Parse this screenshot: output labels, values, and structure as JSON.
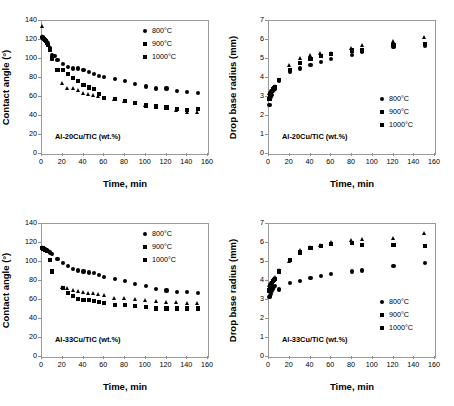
{
  "figure": {
    "xlabel": "Time, min",
    "ylabel_angle": "Contact angle (°)",
    "ylabel_radius": "Drop base radius (mm)",
    "legend_labels": [
      "800°C",
      "900°C",
      "1000°C"
    ],
    "marker_color": "#000000",
    "frame_color": "#9a9a9a"
  },
  "panels": {
    "top_left": {
      "annotation": "Al-20Cu/TiC (wt.%)"
    },
    "top_right": {
      "annotation": "Al-20Cu/TiC (wt.%)"
    },
    "bottom_left": {
      "annotation": "Al-33Cu/TiC (wt.%)"
    },
    "bottom_right": {
      "annotation": "Al-33Cu/TiC (wt.%)"
    }
  },
  "chart_data": [
    {
      "id": "top_left",
      "type": "scatter",
      "title": "",
      "annotation": "Al-20Cu/TiC (wt.%)",
      "xlabel": "Time, min",
      "ylabel": "Contact angle (°)",
      "xlim": [
        0,
        160
      ],
      "ylim": [
        0,
        140
      ],
      "xticks": [
        0,
        20,
        40,
        60,
        80,
        100,
        120,
        140,
        160
      ],
      "yticks": [
        0,
        20,
        40,
        60,
        80,
        100,
        120,
        140
      ],
      "grid": false,
      "legend_position": "top-right",
      "series": [
        {
          "name": "800°C",
          "marker": "circle",
          "x": [
            0.5,
            1,
            2,
            3,
            4,
            5,
            6,
            8,
            10,
            12,
            15,
            20,
            25,
            30,
            35,
            40,
            45,
            50,
            55,
            60,
            70,
            80,
            90,
            100,
            110,
            120,
            130,
            140,
            150
          ],
          "y": [
            123,
            122,
            121,
            120,
            119,
            118,
            117,
            112,
            104,
            103,
            99,
            95,
            92,
            90,
            90,
            88,
            86,
            84,
            82,
            81,
            79,
            77,
            74,
            71,
            69,
            69,
            66,
            65,
            64
          ]
        },
        {
          "name": "900°C",
          "marker": "square",
          "x": [
            0.5,
            1,
            2,
            3,
            4,
            5,
            6,
            8,
            10,
            15,
            20,
            25,
            30,
            35,
            40,
            45,
            50,
            55,
            60,
            70,
            80,
            90,
            100,
            110,
            120,
            130,
            140,
            150
          ],
          "y": [
            122,
            122,
            121,
            120,
            119,
            117,
            115,
            110,
            101,
            88,
            88,
            84,
            80,
            77,
            73,
            70,
            68,
            63,
            59,
            58,
            56,
            54,
            51,
            50,
            49,
            47,
            46,
            47
          ]
        },
        {
          "name": "1000°C",
          "marker": "triangle",
          "x": [
            0.5,
            1,
            2,
            3,
            4,
            5,
            6,
            8,
            10,
            15,
            20,
            25,
            30,
            35,
            40,
            45,
            50,
            55,
            60,
            70,
            80,
            90,
            100,
            110,
            120,
            130,
            140,
            150
          ],
          "y": [
            135,
            124,
            122,
            121,
            120,
            118,
            116,
            112,
            100,
            88,
            75,
            69,
            69,
            67,
            64,
            63,
            62,
            61,
            59,
            58,
            56,
            54,
            51,
            50,
            49,
            46,
            44,
            44
          ]
        }
      ]
    },
    {
      "id": "top_right",
      "type": "scatter",
      "title": "",
      "annotation": "Al-20Cu/TiC (wt.%)",
      "xlabel": "Time, min",
      "ylabel": "Drop base radius (mm)",
      "xlim": [
        0,
        160
      ],
      "ylim": [
        0,
        7
      ],
      "xticks": [
        0,
        20,
        40,
        60,
        80,
        100,
        120,
        140,
        160
      ],
      "yticks": [
        0,
        1,
        2,
        3,
        4,
        5,
        6,
        7
      ],
      "grid": false,
      "legend_position": "bottom-right",
      "series": [
        {
          "name": "800°C",
          "marker": "circle",
          "x": [
            0.5,
            1,
            2,
            3,
            4,
            5,
            6,
            10,
            20,
            30,
            40,
            50,
            60,
            80,
            90,
            120,
            150
          ],
          "y": [
            2.6,
            2.9,
            3.0,
            3.1,
            3.3,
            3.35,
            3.4,
            3.85,
            4.3,
            4.5,
            4.7,
            4.85,
            5.0,
            5.2,
            5.35,
            5.65,
            5.7
          ]
        },
        {
          "name": "900°C",
          "marker": "square",
          "x": [
            0.5,
            1,
            2,
            3,
            4,
            5,
            6,
            10,
            20,
            30,
            40,
            50,
            60,
            80,
            90,
            120,
            150
          ],
          "y": [
            2.9,
            3.05,
            3.15,
            3.3,
            3.4,
            3.45,
            3.5,
            3.9,
            4.4,
            4.8,
            5.0,
            5.15,
            5.25,
            5.45,
            5.45,
            5.75,
            5.8
          ]
        },
        {
          "name": "1000°C",
          "marker": "triangle",
          "x": [
            0.5,
            1,
            2,
            3,
            4,
            5,
            6,
            10,
            20,
            30,
            40,
            50,
            60,
            80,
            90,
            120,
            150
          ],
          "y": [
            3.0,
            3.2,
            3.3,
            3.4,
            3.45,
            3.5,
            3.55,
            3.9,
            4.65,
            5.05,
            5.2,
            5.3,
            5.3,
            5.55,
            5.75,
            5.95,
            6.15
          ]
        }
      ]
    },
    {
      "id": "bottom_left",
      "type": "scatter",
      "title": "",
      "annotation": "Al-33Cu/TiC (wt.%)",
      "xlabel": "Time, min",
      "ylabel": "Contact angle (°)",
      "xlim": [
        0,
        160
      ],
      "ylim": [
        0,
        140
      ],
      "xticks": [
        0,
        20,
        40,
        60,
        80,
        100,
        120,
        140,
        160
      ],
      "yticks": [
        0,
        20,
        40,
        60,
        80,
        100,
        120,
        140
      ],
      "grid": false,
      "legend_position": "top-right",
      "series": [
        {
          "name": "800°C",
          "marker": "circle",
          "x": [
            0.5,
            1,
            2,
            3,
            4,
            5,
            6,
            8,
            10,
            15,
            20,
            25,
            30,
            35,
            40,
            45,
            50,
            55,
            60,
            70,
            80,
            90,
            100,
            110,
            120,
            130,
            140,
            150
          ],
          "y": [
            115,
            115,
            114,
            114,
            113,
            113,
            112,
            110,
            108,
            103,
            99,
            96,
            93,
            91,
            90,
            89,
            88,
            86,
            84,
            82,
            80,
            77,
            75,
            72,
            70,
            68,
            68,
            67
          ]
        },
        {
          "name": "900°C",
          "marker": "square",
          "x": [
            0.5,
            1,
            2,
            3,
            4,
            5,
            8,
            10,
            20,
            25,
            30,
            35,
            40,
            45,
            50,
            55,
            60,
            70,
            80,
            90,
            100,
            110,
            120,
            130,
            140,
            150
          ],
          "y": [
            115,
            114,
            114,
            113,
            113,
            112,
            102,
            90,
            73,
            67,
            64,
            61,
            60,
            60,
            59,
            58,
            57,
            55,
            55,
            54,
            53,
            51,
            51,
            51,
            51,
            51
          ]
        },
        {
          "name": "1000°C",
          "marker": "triangle",
          "x": [
            0.5,
            1,
            2,
            3,
            4,
            5,
            20,
            25,
            30,
            35,
            40,
            45,
            50,
            55,
            60,
            70,
            80,
            90,
            100,
            110,
            120,
            130,
            140,
            150
          ],
          "y": [
            116,
            115,
            114,
            114,
            113,
            112,
            74,
            72,
            70,
            69,
            68,
            67,
            67,
            66,
            65,
            62,
            62,
            61,
            60,
            59,
            58,
            58,
            57,
            57
          ]
        }
      ]
    },
    {
      "id": "bottom_right",
      "type": "scatter",
      "title": "",
      "annotation": "Al-33Cu/TiC (wt.%)",
      "xlabel": "Time, min",
      "ylabel": "Drop base radius (mm)",
      "xlim": [
        0,
        160
      ],
      "ylim": [
        0,
        7
      ],
      "xticks": [
        0,
        20,
        40,
        60,
        80,
        100,
        120,
        140,
        160
      ],
      "yticks": [
        0,
        1,
        2,
        3,
        4,
        5,
        6,
        7
      ],
      "grid": false,
      "legend_position": "bottom-right",
      "series": [
        {
          "name": "800°C",
          "marker": "circle",
          "x": [
            0.5,
            1,
            2,
            3,
            4,
            5,
            6,
            10,
            20,
            30,
            40,
            50,
            60,
            80,
            90,
            120,
            150
          ],
          "y": [
            3.15,
            3.2,
            3.3,
            3.5,
            3.6,
            3.7,
            3.75,
            3.55,
            3.9,
            4.0,
            4.15,
            4.25,
            4.35,
            4.5,
            4.55,
            4.8,
            4.95
          ]
        },
        {
          "name": "900°C",
          "marker": "square",
          "x": [
            0.5,
            1,
            2,
            3,
            4,
            5,
            6,
            10,
            20,
            30,
            40,
            50,
            60,
            80,
            90,
            120,
            150
          ],
          "y": [
            3.5,
            3.7,
            3.8,
            3.9,
            4.0,
            4.05,
            4.1,
            4.5,
            5.1,
            5.5,
            5.75,
            5.85,
            5.95,
            6.0,
            5.9,
            5.9,
            5.85
          ]
        },
        {
          "name": "1000°C",
          "marker": "triangle",
          "x": [
            0.5,
            1,
            2,
            3,
            4,
            5,
            6,
            10,
            20,
            30,
            40,
            50,
            60,
            80,
            90,
            120,
            150
          ],
          "y": [
            3.6,
            3.8,
            3.9,
            4.0,
            4.1,
            4.15,
            4.2,
            4.55,
            5.05,
            5.6,
            5.8,
            5.9,
            6.05,
            6.15,
            6.2,
            6.25,
            6.5
          ]
        }
      ]
    }
  ]
}
